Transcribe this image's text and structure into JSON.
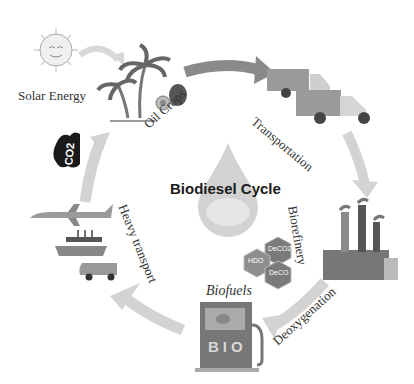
{
  "title": "Biodiesel Cycle",
  "stages": [
    {
      "id": "solar",
      "label": "Solar Energy"
    },
    {
      "id": "crops",
      "label": "Oil Crops"
    },
    {
      "id": "transport",
      "label": "Transportation"
    },
    {
      "id": "refinery",
      "label": "Biorefinery"
    },
    {
      "id": "deox",
      "label": "Deoxygenation"
    },
    {
      "id": "biofuels",
      "label": "Biofuels"
    },
    {
      "id": "heavy",
      "label": "Heavy transport"
    }
  ],
  "co2_label": "CO2",
  "pump_label": "BIO",
  "drop_label": "bio",
  "hexagons": [
    "HDO",
    "DeCO2",
    "DeCO"
  ],
  "colors": {
    "arrow": "#bfbfbf",
    "arrow_dark": "#8a8a8a",
    "text": "#333333",
    "title": "#1a1a1a"
  }
}
